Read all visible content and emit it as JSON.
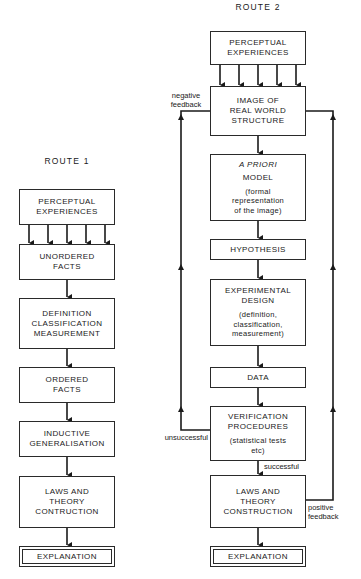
{
  "route1": {
    "title": "ROUTE 1",
    "boxes": [
      {
        "lines": [
          "PERCEPTUAL",
          "EXPERIENCES"
        ]
      },
      {
        "lines": [
          "UNORDERED",
          "FACTS"
        ]
      },
      {
        "lines": [
          "DEFINITION",
          "CLASSIFICATION",
          "MEASUREMENT"
        ]
      },
      {
        "lines": [
          "ORDERED",
          "FACTS"
        ]
      },
      {
        "lines": [
          "INDUCTIVE",
          "GENERALISATION"
        ]
      },
      {
        "lines": [
          "LAWS AND",
          "THEORY",
          "CONTRUCTION"
        ]
      },
      {
        "lines": [
          "EXPLANATION"
        ]
      }
    ]
  },
  "route2": {
    "title": "ROUTE 2",
    "boxes": [
      {
        "lines": [
          "PERCEPTUAL",
          "EXPERIENCES"
        ]
      },
      {
        "lines": [
          "IMAGE OF",
          "REAL WORLD",
          "STRUCTURE"
        ]
      },
      {
        "italic": "A PRIORI",
        "lines": [
          "MODEL"
        ],
        "sub": [
          "(formal",
          "representation",
          "of the image)"
        ]
      },
      {
        "lines": [
          "HYPOTHESIS"
        ]
      },
      {
        "lines": [
          "EXPERIMENTAL",
          "DESIGN"
        ],
        "sub": [
          "(definition,",
          "classification,",
          "measurement)"
        ]
      },
      {
        "lines": [
          "DATA"
        ]
      },
      {
        "lines": [
          "VERIFICATION",
          "PROCEDURES"
        ],
        "sub": [
          "(statistical tests",
          "etc)"
        ]
      },
      {
        "lines": [
          "LAWS AND",
          "THEORY",
          "CONSTRUCTION"
        ]
      },
      {
        "lines": [
          "EXPLANATION"
        ]
      }
    ],
    "labels": {
      "negative_feedback": [
        "negative",
        "feedback"
      ],
      "positive_feedback": [
        "positive",
        "feedback"
      ],
      "unsuccessful": "unsuccessful",
      "successful": "successful"
    }
  }
}
